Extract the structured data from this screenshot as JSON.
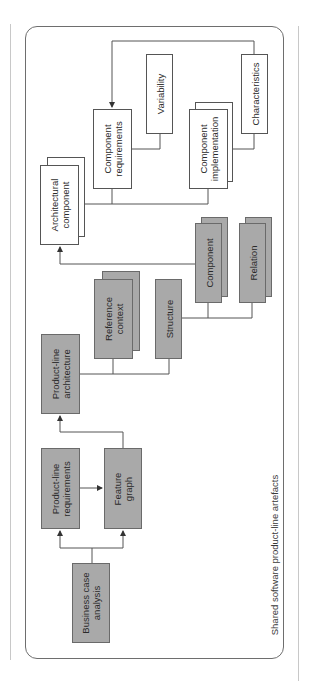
{
  "diagram": {
    "caption": "Shared software product-line artefacts",
    "colors": {
      "artefact_fill": "#a9a9a9",
      "detail_fill": "#ffffff",
      "line": "#555555",
      "frame": "#6e6e6e"
    },
    "nodes": {
      "business_case": {
        "line1": "Business case",
        "line2": "analysis",
        "style": "gray"
      },
      "pl_requirements": {
        "line1": "Product-line",
        "line2": "requirements",
        "style": "gray"
      },
      "feature_graph": {
        "line1": "Feature",
        "line2": "graph",
        "style": "gray"
      },
      "pl_architecture": {
        "line1": "Product-line",
        "line2": "architecture",
        "style": "gray"
      },
      "reference_context": {
        "line1": "Reference",
        "line2": "context",
        "style": "gray-stacked"
      },
      "structure": {
        "line1": "Structure",
        "style": "gray"
      },
      "component": {
        "line1": "Component",
        "style": "gray-stacked"
      },
      "relation": {
        "line1": "Relation",
        "style": "gray-stacked"
      },
      "architectural_component": {
        "line1": "Architectural",
        "line2": "component",
        "style": "white-stacked"
      },
      "component_requirements": {
        "line1": "Component",
        "line2": "requirements",
        "style": "white"
      },
      "variability": {
        "line1": "Variability",
        "style": "white"
      },
      "component_implementation": {
        "line1": "Component",
        "line2": "implementation",
        "style": "white-stacked"
      },
      "characteristics": {
        "line1": "Characteristics",
        "style": "white"
      }
    },
    "edges": [
      {
        "from": "Business case analysis",
        "to": "Product-line requirements",
        "arrow": true
      },
      {
        "from": "Business case analysis",
        "to": "Feature graph",
        "arrow": true
      },
      {
        "from": "Product-line requirements",
        "to": "Feature graph",
        "arrow": true
      },
      {
        "from": "Feature graph",
        "to": "Product-line architecture",
        "arrow": true
      },
      {
        "from": "Product-line architecture",
        "to": "Reference context",
        "arrow": false
      },
      {
        "from": "Product-line architecture",
        "to": "Structure",
        "arrow": false
      },
      {
        "from": "Structure",
        "to": "Component",
        "arrow": false
      },
      {
        "from": "Structure",
        "to": "Relation",
        "arrow": false
      },
      {
        "from": "Component",
        "to": "Architectural component",
        "arrow": true
      },
      {
        "from": "Architectural component",
        "to": "Component requirements",
        "arrow": false
      },
      {
        "from": "Architectural component",
        "to": "Component implementation",
        "arrow": false
      },
      {
        "from": "Component requirements",
        "to": "Variability",
        "arrow": false
      },
      {
        "from": "Component implementation",
        "to": "Characteristics",
        "arrow": false
      },
      {
        "from": "Characteristics",
        "to": "Component requirements",
        "arrow": true
      }
    ]
  }
}
